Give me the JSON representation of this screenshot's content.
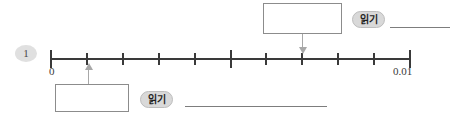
{
  "worksheet": {
    "problem_number": "1",
    "reading_label": "읽기"
  },
  "chart_data": {
    "type": "numberline",
    "title": "",
    "xlabel": "",
    "axis_start_label": "0",
    "axis_end_label": "0.01",
    "axis_min": 0,
    "axis_max": 0.01,
    "tick_count": 11,
    "tick_interval": 0.001,
    "major_tick_indices": [
      0,
      5,
      10
    ],
    "tick_labels": [
      "0",
      "",
      "",
      "",
      "",
      "",
      "",
      "",
      "",
      "",
      "0.01"
    ],
    "markers": [
      {
        "name": "upper-marker",
        "index": 7,
        "value": 0.007,
        "direction": "down",
        "answer_box_value": ""
      },
      {
        "name": "lower-marker",
        "index": 1,
        "value": 0.001,
        "direction": "up",
        "answer_box_value": ""
      }
    ],
    "grid": false,
    "legend": "none"
  },
  "answers": {
    "top_box_value": "",
    "bottom_box_value": "",
    "top_rule_value": "",
    "bottom_rule_value": ""
  }
}
